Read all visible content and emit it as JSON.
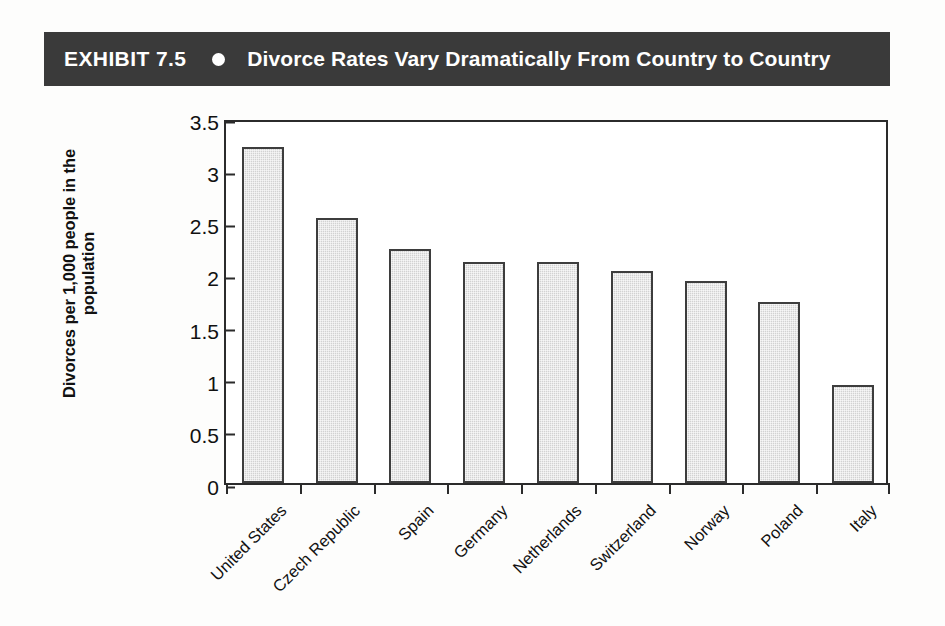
{
  "exhibit": {
    "number": "EXHIBIT 7.5",
    "bullet_icon": "filled-circle-bullet",
    "title": "Divorce Rates Vary Dramatically From Country to Country",
    "header_background": "#3a3a3a",
    "header_text_color": "#ffffff"
  },
  "chart_data": {
    "type": "bar",
    "title": "Divorce Rates Vary Dramatically From Country to Country",
    "subtitle": "",
    "xlabel": "",
    "ylabel": "Divorces per 1,000 people in the population",
    "ylabel_line1": "Divorces per 1,000 people in the",
    "ylabel_line2": "population",
    "categories": [
      "United States",
      "Czech Republic",
      "Spain",
      "Germany",
      "Netherlands",
      "Switzerland",
      "Norway",
      "Poland",
      "Italy"
    ],
    "values": [
      3.22,
      2.54,
      2.24,
      2.12,
      2.12,
      2.03,
      1.94,
      1.74,
      0.94
    ],
    "ylim": [
      0,
      3.5
    ],
    "yticks": [
      0,
      0.5,
      1,
      1.5,
      2,
      2.5,
      3,
      3.5
    ],
    "ytick_labels": [
      "0",
      "0.5",
      "1",
      "1.5",
      "2",
      "2.5",
      "3",
      "3.5"
    ],
    "grid": false,
    "legend": false,
    "legend_position": "none",
    "bar_fill_color": "#d2d2d2",
    "bar_border_color": "#3d3d3d",
    "axis_color": "#2b2b2b",
    "plot_background": "#ffffff"
  }
}
